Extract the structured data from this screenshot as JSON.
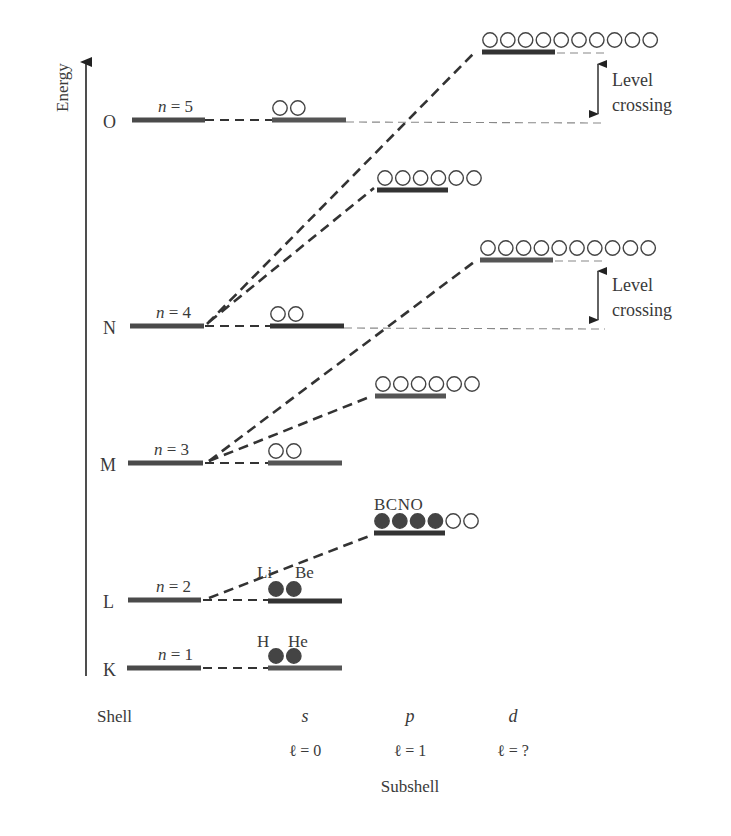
{
  "axis": {
    "label": "Energy",
    "x": 86,
    "y_top": 60,
    "y_bottom": 676
  },
  "colors": {
    "level": "#4a4a4a",
    "dash": "#333333",
    "thin_dash": "#888888",
    "filled": "#444444",
    "empty_stroke": "#444444",
    "text": "#3a3a3a"
  },
  "shells": [
    {
      "letter": "O",
      "n_label": "n = 5",
      "y": 120,
      "x1": 132,
      "x2": 205,
      "letter_x": 103,
      "n_x": 158
    },
    {
      "letter": "N",
      "n_label": "n = 4",
      "y": 326,
      "x1": 130,
      "x2": 204,
      "letter_x": 103,
      "n_x": 156
    },
    {
      "letter": "M",
      "n_label": "n = 3",
      "y": 463,
      "x1": 128,
      "x2": 203,
      "letter_x": 100,
      "n_x": 154
    },
    {
      "letter": "L",
      "n_label": "n = 2",
      "y": 600,
      "x1": 128,
      "x2": 201,
      "letter_x": 103,
      "n_x": 156
    },
    {
      "letter": "K",
      "n_label": "n = 1",
      "y": 668,
      "x1": 127,
      "x2": 201,
      "letter_x": 103,
      "n_x": 158
    }
  ],
  "subshells": [
    {
      "id": "5s",
      "x1": 272,
      "x2": 346,
      "y": 120,
      "slots": 2,
      "filled": 0,
      "color": "#555"
    },
    {
      "id": "4s",
      "x1": 270,
      "x2": 344,
      "y": 326,
      "slots": 2,
      "filled": 0,
      "color": "#333"
    },
    {
      "id": "3s",
      "x1": 268,
      "x2": 342,
      "y": 463,
      "slots": 2,
      "filled": 0,
      "color": "#555"
    },
    {
      "id": "2s",
      "x1": 268,
      "x2": 342,
      "y": 601,
      "slots": 2,
      "filled": 2,
      "color": "#333"
    },
    {
      "id": "1s",
      "x1": 268,
      "x2": 342,
      "y": 668,
      "slots": 2,
      "filled": 2,
      "color": "#555"
    },
    {
      "id": "4p",
      "x1": 377,
      "x2": 448,
      "y": 190,
      "slots": 6,
      "filled": 0,
      "color": "#333"
    },
    {
      "id": "3p",
      "x1": 375,
      "x2": 446,
      "y": 396,
      "slots": 6,
      "filled": 0,
      "color": "#555"
    },
    {
      "id": "2p",
      "x1": 374,
      "x2": 445,
      "y": 533,
      "slots": 6,
      "filled": 4,
      "color": "#333"
    },
    {
      "id": "4d",
      "x1": 482,
      "x2": 555,
      "y": 52,
      "slots": 10,
      "filled": 0,
      "color": "#333"
    },
    {
      "id": "3d",
      "x1": 480,
      "x2": 553,
      "y": 260,
      "slots": 10,
      "filled": 0,
      "color": "#555"
    }
  ],
  "element_labels": [
    {
      "text": "Li",
      "x": 257,
      "y": 578
    },
    {
      "text": "Be",
      "x": 295,
      "y": 578
    },
    {
      "text": "H",
      "x": 257,
      "y": 647
    },
    {
      "text": "He",
      "x": 288,
      "y": 647
    },
    {
      "text": "BCNO",
      "x": 374,
      "y": 510
    }
  ],
  "connectors": [
    {
      "from": [
        205,
        120
      ],
      "to": [
        272,
        120
      ],
      "style": "shell"
    },
    {
      "from": [
        205,
        326
      ],
      "to": [
        270,
        326
      ],
      "style": "shell"
    },
    {
      "from": [
        205,
        463
      ],
      "to": [
        268,
        463
      ],
      "style": "shell"
    },
    {
      "from": [
        203,
        600
      ],
      "to": [
        268,
        600
      ],
      "style": "shell"
    },
    {
      "from": [
        203,
        668
      ],
      "to": [
        268,
        668
      ],
      "style": "shell"
    },
    {
      "from": [
        207,
        324
      ],
      "to": [
        475,
        52
      ],
      "style": "diag"
    },
    {
      "from": [
        209,
        322
      ],
      "to": [
        374,
        188
      ],
      "style": "diag"
    },
    {
      "from": [
        209,
        461
      ],
      "to": [
        474,
        262
      ],
      "style": "diag"
    },
    {
      "from": [
        209,
        461
      ],
      "to": [
        372,
        396
      ],
      "style": "diag"
    },
    {
      "from": [
        209,
        598
      ],
      "to": [
        372,
        535
      ],
      "style": "diag"
    },
    {
      "from": [
        346,
        122
      ],
      "to": [
        605,
        123
      ],
      "style": "thin"
    },
    {
      "from": [
        344,
        328
      ],
      "to": [
        605,
        329
      ],
      "style": "thin"
    },
    {
      "from": [
        557,
        53
      ],
      "to": [
        605,
        53
      ],
      "style": "thin"
    },
    {
      "from": [
        555,
        261
      ],
      "to": [
        605,
        261
      ],
      "style": "thin"
    }
  ],
  "level_crossings": [
    {
      "x": 598,
      "y_top": 58,
      "y_bottom": 120,
      "line1": "Level",
      "line2": "crossing",
      "label_x": 612,
      "label_y1": 86,
      "label_y2": 111
    },
    {
      "x": 598,
      "y_top": 265,
      "y_bottom": 326,
      "line1": "Level",
      "line2": "crossing",
      "label_x": 612,
      "label_y1": 291,
      "label_y2": 316
    }
  ],
  "bottom": {
    "shell_label": "Shell",
    "subshell_label": "Subshell",
    "columns": [
      {
        "letter": "s",
        "l_label": "ℓ = 0",
        "x": 305
      },
      {
        "letter": "p",
        "l_label": "ℓ = 1",
        "x": 410
      },
      {
        "letter": "d",
        "l_label": "ℓ = ?",
        "x": 513
      }
    ]
  }
}
